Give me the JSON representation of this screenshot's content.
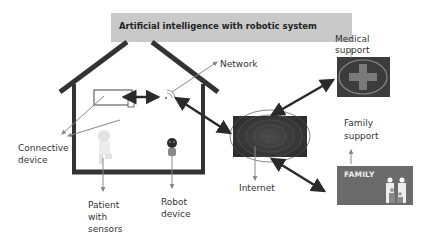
{
  "title": "Artificial intelligence with robotic system",
  "labels": {
    "network": "Network",
    "medical_support_line1": "Medical",
    "medical_support_line2": "support",
    "family_support_line1": "Family",
    "family_support_line2": "support",
    "connective_device_line1": "Connective",
    "connective_device_line2": "device",
    "internet": "Internet",
    "patient_line1": "Patient",
    "patient_line2": "with",
    "patient_line3": "sensors",
    "robot_line1": "Robot",
    "robot_line2": "device",
    "family_badge": "FAMILY"
  },
  "colors": {
    "banner": "#c9c9c9",
    "house": "#333333",
    "arrow_dark": "#2a2a2a",
    "arrow_light": "#888888",
    "internet_box": "#3a3a3a",
    "medical_box": "#3c3c3c",
    "family_box": "#6b6b6b"
  }
}
